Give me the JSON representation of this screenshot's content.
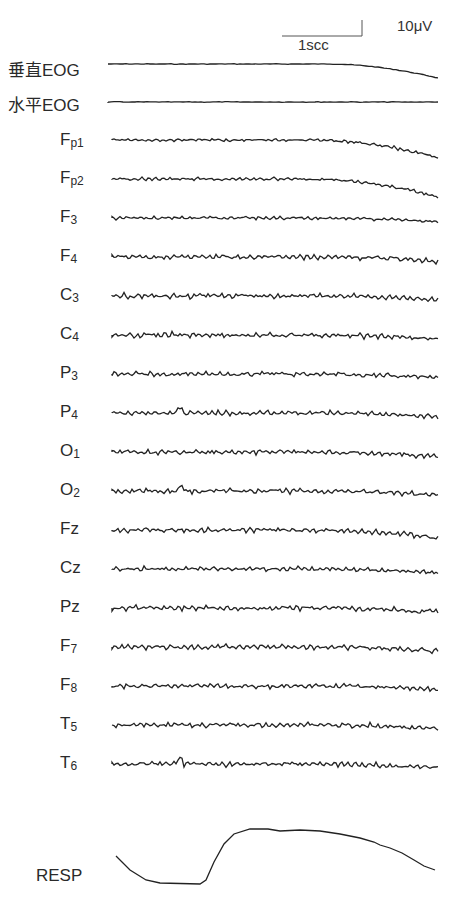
{
  "chart_data": {
    "type": "line",
    "title": "",
    "scale_bar": {
      "amplitude": "10μV",
      "time": "1scc"
    },
    "xlabel": "",
    "ylabel": "",
    "channels": [
      {
        "name": "垂直EOG",
        "shape": "flat, downward drift at end"
      },
      {
        "name": "水平EOG",
        "shape": "flat"
      },
      {
        "name": "Fp1",
        "shape": "low-amplitude noise, downward drift at end"
      },
      {
        "name": "Fp2",
        "shape": "low-amplitude noise, downward drift at end"
      },
      {
        "name": "F3",
        "shape": "low-amplitude noise"
      },
      {
        "name": "F4",
        "shape": "alpha-like waves"
      },
      {
        "name": "C3",
        "shape": "alpha-like waves"
      },
      {
        "name": "C4",
        "shape": "alpha-like waves"
      },
      {
        "name": "P3",
        "shape": "alpha-like waves"
      },
      {
        "name": "P4",
        "shape": "alpha-like waves with spike"
      },
      {
        "name": "O1",
        "shape": "alpha-like waves"
      },
      {
        "name": "O2",
        "shape": "alpha-like waves with spike"
      },
      {
        "name": "Fz",
        "shape": "alpha-like waves, drift at end"
      },
      {
        "name": "Cz",
        "shape": "alpha-like waves"
      },
      {
        "name": "Pz",
        "shape": "alpha-like waves"
      },
      {
        "name": "F7",
        "shape": "alpha-like waves"
      },
      {
        "name": "F8",
        "shape": "higher-frequency waves"
      },
      {
        "name": "T5",
        "shape": "alpha-like waves"
      },
      {
        "name": "T6",
        "shape": "alpha-like waves with spike"
      },
      {
        "name": "RESP",
        "shape": "low plateau then rise to high plateau then slow decline"
      }
    ],
    "grid": false,
    "legend": "channel labels on left"
  },
  "labels": {
    "scale_amplitude": "10μV",
    "scale_time": "1scc",
    "veog": "垂直EOG",
    "heog": "水平EOG",
    "fp1": {
      "base": "F",
      "sub": "p1"
    },
    "fp2": {
      "base": "F",
      "sub": "p2"
    },
    "f3": {
      "base": "F",
      "sub": "3"
    },
    "f4": {
      "base": "F",
      "sub": "4"
    },
    "c3": {
      "base": "C",
      "sub": "3"
    },
    "c4": {
      "base": "C",
      "sub": "4"
    },
    "p3": {
      "base": "P",
      "sub": "3"
    },
    "p4": {
      "base": "P",
      "sub": "4"
    },
    "o1": {
      "base": "O",
      "sub": "1"
    },
    "o2": {
      "base": "O",
      "sub": "2"
    },
    "fz": "Fz",
    "cz": "Cz",
    "pz": "Pz",
    "f7": {
      "base": "F",
      "sub": "7"
    },
    "f8": {
      "base": "F",
      "sub": "8"
    },
    "t5": {
      "base": "T",
      "sub": "5"
    },
    "t6": {
      "base": "T",
      "sub": "6"
    },
    "resp": "RESP"
  }
}
